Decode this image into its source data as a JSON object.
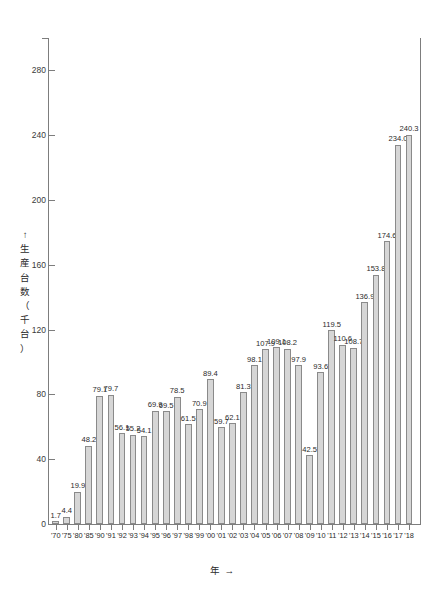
{
  "chart_data": {
    "type": "bar",
    "title": "",
    "xlabel": "年 →",
    "ylabel": "↑ 生産台数（千台）",
    "ylabel_chars": [
      "↑",
      "生",
      "産",
      "台",
      "数",
      "（",
      "千",
      "台",
      "）"
    ],
    "ylim": [
      0,
      300
    ],
    "yticks": [
      0,
      40,
      80,
      120,
      160,
      200,
      240,
      280
    ],
    "grid": false,
    "legend": null,
    "bar_color": "#d6d6d6",
    "bar_edge_color": "#8a8a8a",
    "axis_color": "#7d7d7d",
    "categories": [
      "'70",
      "'75",
      "'80",
      "'85",
      "'90",
      "'91",
      "'92",
      "'93",
      "'94",
      "'95",
      "'96",
      "'97",
      "'98",
      "'99",
      "'00",
      "'01",
      "'02",
      "'03",
      "'04",
      "'05",
      "'06",
      "'07",
      "'08",
      "'09",
      "'10",
      "'11",
      "'12",
      "'13",
      "'14",
      "'15",
      "'16",
      "'17",
      "'18"
    ],
    "values": [
      1.7,
      4.4,
      19.9,
      48.2,
      79.1,
      79.7,
      56.1,
      55.2,
      54.1,
      69.9,
      69.5,
      78.5,
      61.5,
      70.9,
      89.4,
      59.7,
      62.1,
      81.3,
      98.1,
      107.9,
      109.1,
      108.2,
      97.9,
      42.5,
      93.6,
      119.5,
      110.6,
      108.7,
      136.9,
      153.8,
      174.6,
      234.0,
      240.3
    ],
    "value_labels": [
      "1.7",
      "4.4",
      "19.9",
      "48.2",
      "79.1",
      "79.7",
      "56.1",
      "55.2",
      "54.1",
      "69.9",
      "69.5",
      "78.5",
      "61.5",
      "70.9",
      "89.4",
      "59.7",
      "62.1",
      "81.3",
      "98.1",
      "107.9",
      "109.1",
      "108.2",
      "97.9",
      "42.5",
      "93.6",
      "119.5",
      "110.6",
      "108.7",
      "136.9",
      "153.8",
      "174.6",
      "234.0",
      "240.3"
    ]
  }
}
